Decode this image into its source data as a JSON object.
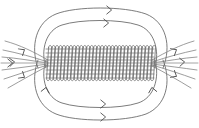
{
  "figure": {
    "title": "Magnetic field of a current-carrying solenoid",
    "type": "physics-field-diagram",
    "canvas": {
      "width": 199,
      "height": 128,
      "background": "#ffffff"
    },
    "style": {
      "field_line_color": "#5a5a5a",
      "coil_color": "#6b6b6b",
      "axis_color": "#9a9a9a",
      "arrow_color": "#4f4f4f",
      "stroke_width": 0.8
    }
  },
  "solenoid": {
    "label": "solenoid-coil",
    "turns": 31,
    "x_start": 48,
    "x_end": 152,
    "y_top": 46,
    "y_bottom": 80,
    "turn_spacing": 3.35,
    "loop_tilt": 2.0,
    "interior_lines": 9,
    "interior_line_top": 48,
    "interior_line_bottom": 79
  },
  "field_loops": {
    "top": [
      {
        "name": "outer-top-loop",
        "rx": 72,
        "ry": 29,
        "cx": 99,
        "cy": 49
      },
      {
        "name": "inner-top-loop",
        "rx": 58,
        "ry": 21,
        "cx": 99,
        "cy": 54
      }
    ],
    "bottom": [
      {
        "name": "outer-bottom-loop",
        "rx": 72,
        "ry": 29,
        "cx": 99,
        "cy": 78
      },
      {
        "name": "inner-bottom-loop",
        "rx": 58,
        "ry": 21,
        "cx": 99,
        "cy": 73
      }
    ]
  },
  "fringe_fields": {
    "left_label": "left-end-fringe-fan",
    "right_label": "right-end-fringe-fan",
    "rays_per_side": 5,
    "direction": "rightward"
  },
  "arrows": [
    {
      "name": "arrow-top-outer",
      "x": 111,
      "y": 10,
      "rotation": 0
    },
    {
      "name": "arrow-top-inner",
      "x": 108,
      "y": 23,
      "rotation": 0
    },
    {
      "name": "arrow-bottom-inner",
      "x": 105,
      "y": 104,
      "rotation": 0
    },
    {
      "name": "arrow-bottom-outer",
      "x": 105,
      "y": 117,
      "rotation": 0
    },
    {
      "name": "arrow-left-upper-fringe",
      "x": 24,
      "y": 50,
      "rotation": -32
    },
    {
      "name": "arrow-left-mid-fringe",
      "x": 14,
      "y": 62,
      "rotation": -4
    },
    {
      "name": "arrow-left-lower-fringe",
      "x": 24,
      "y": 77,
      "rotation": 32
    },
    {
      "name": "arrow-left-axis",
      "x": 12,
      "y": 63,
      "rotation": 0
    },
    {
      "name": "arrow-right-upper-fringe",
      "x": 176,
      "y": 50,
      "rotation": -30
    },
    {
      "name": "arrow-right-mid-fringe",
      "x": 184,
      "y": 62,
      "rotation": -3
    },
    {
      "name": "arrow-right-lower-fringe",
      "x": 176,
      "y": 76,
      "rotation": 30
    },
    {
      "name": "arrow-bottom-left-return",
      "x": 46,
      "y": 88,
      "rotation": -78
    },
    {
      "name": "arrow-bottom-right-return",
      "x": 152,
      "y": 88,
      "rotation": -100
    }
  ],
  "chart_data": {
    "type": "line",
    "title": "Magnetic field of a current-carrying solenoid",
    "xlabel": "",
    "ylabel": "",
    "series": [
      {
        "name": "outer-top-field-loop",
        "values": []
      },
      {
        "name": "inner-top-field-loop",
        "values": []
      },
      {
        "name": "inner-bottom-field-loop",
        "values": []
      },
      {
        "name": "outer-bottom-field-loop",
        "values": []
      },
      {
        "name": "axial-interior-field-lines",
        "values": []
      },
      {
        "name": "end-fringe-field-rays",
        "values": []
      }
    ]
  }
}
